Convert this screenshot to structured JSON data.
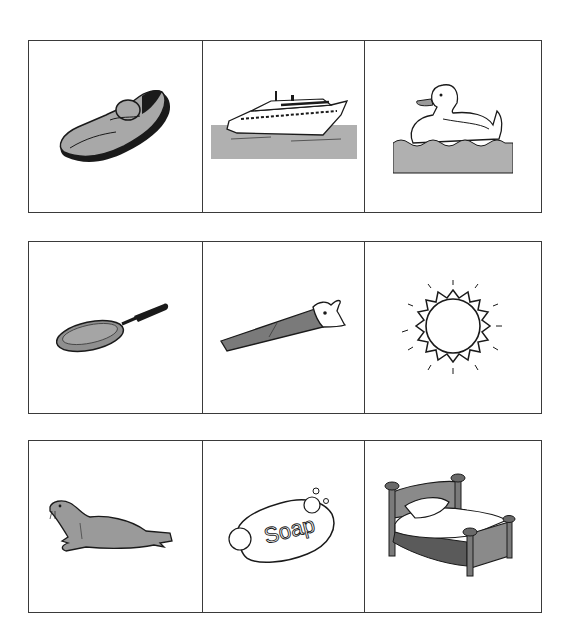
{
  "worksheet": {
    "rows": [
      {
        "cells": [
          {
            "picture": "shoe"
          },
          {
            "picture": "boat"
          },
          {
            "picture": "duck"
          }
        ]
      },
      {
        "cells": [
          {
            "picture": "pan"
          },
          {
            "picture": "saw"
          },
          {
            "picture": "sun"
          }
        ]
      },
      {
        "cells": [
          {
            "picture": "seal"
          },
          {
            "picture": "soap"
          },
          {
            "picture": "bed"
          }
        ]
      }
    ],
    "soap_text": "Soap"
  },
  "colors": {
    "border": "#3a3a3a",
    "fill_gray": "#a8a8a8",
    "dark_gray": "#6f6f6f",
    "outline": "#1a1a1a",
    "water": "#b0b0b0"
  }
}
